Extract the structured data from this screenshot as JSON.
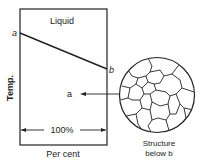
{
  "diagram": {
    "region_label": "Liquid",
    "y_axis_label": "Temp.",
    "x_axis_label": "Per cent",
    "span_label": "100%",
    "point_a_top": "a",
    "point_b": "b",
    "point_a_region": "a",
    "structure_caption_line1": "Structure",
    "structure_caption_line2": "below b"
  }
}
